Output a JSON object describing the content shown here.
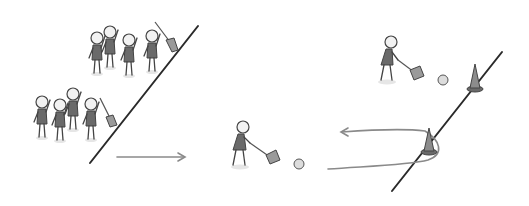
{
  "scene": {
    "description": "Relay game illustration: two teams of stick figures behind a start line, a player sweeping a ball with a broom toward a cone, turning around the cone and returning.",
    "colors": {
      "background": "#ffffff",
      "line": "#2a2a2a",
      "arrow": "#8a8a8a",
      "figure_body": "#6a6a6a",
      "cone": "#8c8c8c"
    },
    "team_top_count": 4,
    "team_bottom_count": 4,
    "cones": 2,
    "balls": 2
  }
}
